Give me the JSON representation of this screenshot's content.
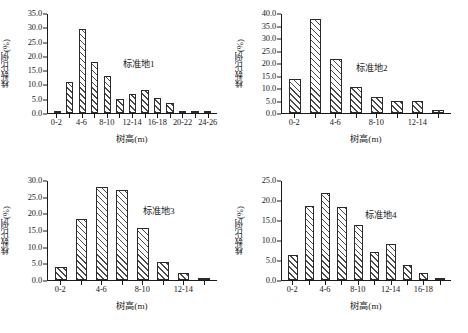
{
  "figure": {
    "axis_labels": {
      "x": "树高(m)",
      "y": "株数比例(%)"
    }
  },
  "chart_data": [
    {
      "type": "bar",
      "title": "标准地1",
      "xlabel": "树高(m)",
      "ylabel": "株数比例(%)",
      "ylim": [
        0,
        35
      ],
      "yticks": [
        "0.0",
        "5.0",
        "10.0",
        "15.0",
        "20.0",
        "25.0",
        "30.0",
        "35.0"
      ],
      "ytick_values": [
        0,
        5,
        10,
        15,
        20,
        25,
        30,
        35
      ],
      "grid": false,
      "legend": "none",
      "categories": [
        "0-2",
        "2-4",
        "4-6",
        "6-8",
        "8-10",
        "10-12",
        "12-14",
        "14-16",
        "16-18",
        "18-20",
        "20-22",
        "22-24",
        "24-26"
      ],
      "xtick_labels": [
        "0-2",
        "4-6",
        "8-10",
        "12-14",
        "16-18",
        "20-22",
        "24-26"
      ],
      "xtick_indices": [
        0,
        2,
        4,
        6,
        8,
        10,
        12
      ],
      "values": [
        0.5,
        11.0,
        29.3,
        17.9,
        12.9,
        5.0,
        6.7,
        7.9,
        5.2,
        3.5,
        0.4,
        0.2,
        0.3
      ]
    },
    {
      "type": "bar",
      "title": "标准地2",
      "xlabel": "树高(m)",
      "ylabel": "株数比例(%)",
      "ylim": [
        0,
        40
      ],
      "yticks": [
        "0.0",
        "5.0",
        "10.0",
        "15.0",
        "20.0",
        "25.0",
        "30.0",
        "35.0",
        "40.0"
      ],
      "ytick_values": [
        0,
        5,
        10,
        15,
        20,
        25,
        30,
        35,
        40
      ],
      "grid": false,
      "legend": "none",
      "categories": [
        "0-2",
        "2-4",
        "4-6",
        "6-8",
        "8-10",
        "10-12",
        "12-14",
        "14-16"
      ],
      "xtick_labels": [
        "0-2",
        "4-6",
        "8-10",
        "12-14"
      ],
      "xtick_indices": [
        0,
        2,
        4,
        6
      ],
      "values": [
        13.8,
        37.6,
        21.5,
        10.5,
        6.5,
        4.7,
        4.7,
        1.3
      ]
    },
    {
      "type": "bar",
      "title": "标准地3",
      "xlabel": "树高(m)",
      "ylabel": "株数比例(%)",
      "ylim": [
        0,
        30
      ],
      "yticks": [
        "0.0",
        "5.0",
        "10.0",
        "15.0",
        "20.0",
        "25.0",
        "30.0"
      ],
      "ytick_values": [
        0,
        5,
        10,
        15,
        20,
        25,
        30
      ],
      "grid": false,
      "legend": "none",
      "categories": [
        "0-2",
        "2-4",
        "4-6",
        "6-8",
        "8-10",
        "10-12",
        "12-14",
        "14-16"
      ],
      "xtick_labels": [
        "0-2",
        "4-6",
        "8-10",
        "12-14"
      ],
      "xtick_indices": [
        0,
        2,
        4,
        6
      ],
      "values": [
        3.9,
        18.3,
        27.8,
        26.9,
        15.7,
        5.4,
        2.2,
        0.3
      ]
    },
    {
      "type": "bar",
      "title": "标准地4",
      "xlabel": "树高(m)",
      "ylabel": "株数比例(%)",
      "ylim": [
        0,
        25
      ],
      "yticks": [
        "0.0",
        "5.0",
        "10.0",
        "15.0",
        "20.0",
        "25.0"
      ],
      "ytick_values": [
        0,
        5,
        10,
        15,
        20,
        25
      ],
      "grid": false,
      "legend": "none",
      "categories": [
        "0-2",
        "2-4",
        "4-6",
        "6-8",
        "8-10",
        "10-12",
        "12-14",
        "14-16",
        "16-18",
        "18-20"
      ],
      "xtick_labels": [
        "0-2",
        "4-6",
        "8-10",
        "12-14",
        "16-18"
      ],
      "xtick_indices": [
        0,
        2,
        4,
        6,
        8
      ],
      "values": [
        6.2,
        18.6,
        21.7,
        18.2,
        13.7,
        7.0,
        9.0,
        3.8,
        1.7,
        0.2
      ]
    }
  ]
}
